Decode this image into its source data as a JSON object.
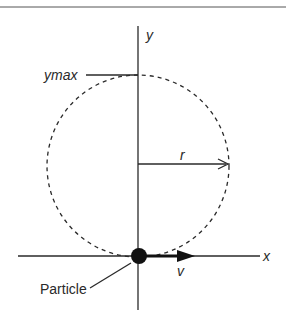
{
  "diagram": {
    "labels": {
      "y_axis": "y",
      "x_axis": "x",
      "ymax": "ymax",
      "radius": "r",
      "velocity": "v",
      "particle": "Particle"
    },
    "colors": {
      "line": "#2a2a2a",
      "background": "#ffffff"
    }
  }
}
